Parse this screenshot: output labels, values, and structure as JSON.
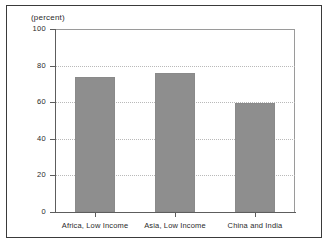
{
  "figure": {
    "unit_caption": "(percent)",
    "background_color": "#ffffff",
    "frame_color": "#3a3a3a"
  },
  "chart_data": {
    "type": "bar",
    "title": "",
    "subtitle": "",
    "xlabel": "",
    "ylabel": "(percent)",
    "categories": [
      "Africa, Low Income",
      "Asia, Low Income",
      "China and India"
    ],
    "values": [
      74,
      76,
      59.5
    ],
    "series": [
      {
        "name": "",
        "values": [
          74,
          76,
          59.5
        ]
      }
    ],
    "ylim": [
      0,
      100
    ],
    "yticks": [
      0,
      20,
      40,
      60,
      80,
      100
    ],
    "ytick_labels": [
      "0",
      "20",
      "40",
      "60",
      "80",
      "100"
    ],
    "grid": true,
    "grid_axis": "y",
    "grid_style": "dotted",
    "legend": false,
    "legend_position": "none",
    "bar_color": "#8e8e8e",
    "gridline_color": "#b9b9b9",
    "axis_color": "#5d5d5d"
  }
}
